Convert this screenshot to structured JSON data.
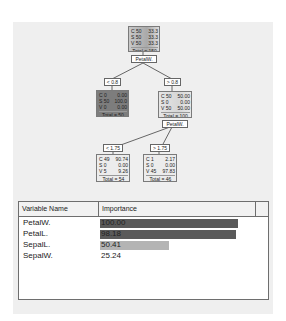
{
  "tree": {
    "root": {
      "rows": [
        [
          "C 50",
          "33.3"
        ],
        [
          "S 50",
          "33.3"
        ],
        [
          "V 50",
          "33.3"
        ]
      ],
      "total": "Total = 150",
      "split": "PetalW."
    },
    "left": {
      "cond": "< 0.8",
      "rows": [
        [
          "C 0",
          "0.00"
        ],
        [
          "S 50",
          "100.0"
        ],
        [
          "V 0",
          "0.00"
        ]
      ],
      "total": "Total = 50"
    },
    "right": {
      "cond": "> 0.8",
      "rows": [
        [
          "C 50",
          "50.00"
        ],
        [
          "S 0",
          "0.00"
        ],
        [
          "V 50",
          "50.00"
        ]
      ],
      "total": "Total = 100",
      "split": "PetalW."
    },
    "rl": {
      "cond": "< 1.75",
      "rows": [
        [
          "C 49",
          "90.74"
        ],
        [
          "S 0",
          "0.00"
        ],
        [
          "V 5",
          "9.26"
        ]
      ],
      "total": "Total = 54"
    },
    "rr": {
      "cond": "> 1.75",
      "rows": [
        [
          "C 1",
          "2.17"
        ],
        [
          "S 0",
          "0.00"
        ],
        [
          "V 45",
          "97.83"
        ]
      ],
      "total": "Total = 46"
    }
  },
  "table": {
    "headers": [
      "Variable Name",
      "Importance",
      ""
    ],
    "rows": [
      {
        "name": "PetalW.",
        "value": "100.00",
        "pct": 100,
        "color": "#5a5a5a"
      },
      {
        "name": "PetalL.",
        "value": "98.18",
        "pct": 98.18,
        "color": "#5a5a5a"
      },
      {
        "name": "SepalL.",
        "value": "50.41",
        "pct": 50.41,
        "color": "#b4b4b4"
      },
      {
        "name": "SepalW.",
        "value": "25.24",
        "pct": 0,
        "color": "#ffffff"
      }
    ]
  }
}
